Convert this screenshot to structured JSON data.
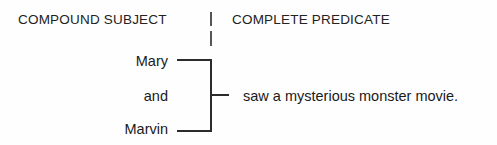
{
  "diagram": {
    "kind": "sentence-structure-diagram",
    "width": 497,
    "height": 145,
    "background_color": "#fefefe",
    "line_color": "#2b2b2b",
    "divider_color": "#555555",
    "text_color": "#1a1a1a"
  },
  "headers": {
    "subject": "COMPOUND SUBJECT",
    "predicate": "COMPLETE PREDICATE"
  },
  "subject": {
    "words": [
      {
        "label": "Mary"
      },
      {
        "label": "and"
      },
      {
        "label": "Marvin"
      }
    ]
  },
  "predicate": {
    "text": "saw a mysterious monster movie."
  }
}
